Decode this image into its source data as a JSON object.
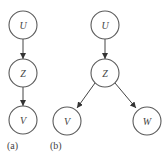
{
  "diagram": {
    "panels": [
      {
        "label": "(a)",
        "nodes": [
          {
            "id": "U",
            "label": "U"
          },
          {
            "id": "Z",
            "label": "Z"
          },
          {
            "id": "V",
            "label": "V"
          }
        ],
        "edges": [
          {
            "from": "U",
            "to": "Z"
          },
          {
            "from": "Z",
            "to": "V"
          }
        ]
      },
      {
        "label": "(b)",
        "nodes": [
          {
            "id": "U",
            "label": "U"
          },
          {
            "id": "Z",
            "label": "Z"
          },
          {
            "id": "V",
            "label": "V"
          },
          {
            "id": "W",
            "label": "W"
          }
        ],
        "edges": [
          {
            "from": "U",
            "to": "Z"
          },
          {
            "from": "Z",
            "to": "V"
          },
          {
            "from": "Z",
            "to": "W"
          }
        ]
      }
    ],
    "colors": {
      "stroke": "#5a5a5a",
      "text": "#444444",
      "background": "#ffffff"
    }
  }
}
